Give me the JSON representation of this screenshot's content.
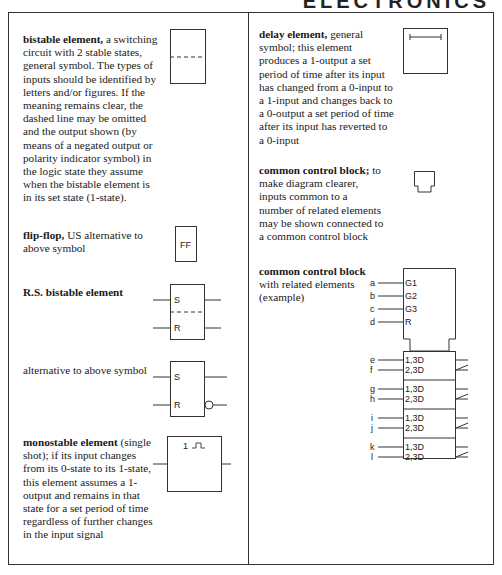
{
  "header": {
    "title": "ELECTRONICS"
  },
  "left_column": {
    "entries": [
      {
        "term": "bistable element,",
        "description": "a switching circuit with 2 stable states, general symbol. The types of inputs should be identified by letters and/or figures. If the meaning remains clear, the dashed line may be omitted and the output shown (by means of a negated output or polarity indicator symbol) in the logic state they assume when the bistable element is in its set state (1-state).",
        "symbol": "bistable-general-symbol"
      },
      {
        "term": "flip-flop,",
        "description": "US alternative to above symbol",
        "symbol": "flip-flop-symbol",
        "symbol_label": "FF"
      },
      {
        "term": "R.S. bistable element",
        "description": "",
        "symbol": "rs-bistable-symbol",
        "symbol_labels": [
          "S",
          "R"
        ]
      },
      {
        "term": "",
        "description": "alternative to above symbol",
        "symbol": "rs-bistable-alt-symbol",
        "symbol_labels": [
          "S",
          "R"
        ]
      },
      {
        "term": "monostable element",
        "description": "(single shot); if its input changes from its 0-state to its 1-state, this element assumes a 1-output and remains in that state for a set period of time regardless of further changes in the input signal",
        "symbol": "monostable-symbol",
        "symbol_label": "1"
      }
    ]
  },
  "right_column": {
    "entries": [
      {
        "term": "delay element,",
        "description": "general symbol; this element produces a 1-output a set period of time after its input has changed from a 0-input to a 1-input and changes back to a 0-output a set period of time after its input has reverted to a 0-input",
        "symbol": "delay-element-symbol"
      },
      {
        "term": "common control block;",
        "description": "to make diagram clearer, inputs common to a number of related elements may be shown connected to a common control block",
        "symbol": "common-control-block-symbol"
      },
      {
        "term": "common control block",
        "description": "with related elements (example)",
        "symbol": "common-control-block-example",
        "control_inputs": [
          {
            "pin": "a",
            "label": "G1"
          },
          {
            "pin": "b",
            "label": "G2"
          },
          {
            "pin": "c",
            "label": "G3"
          },
          {
            "pin": "d",
            "label": "R"
          }
        ],
        "elements": [
          {
            "inputs": [
              {
                "pin": "e",
                "label": "1,3D"
              },
              {
                "pin": "f",
                "label": "2,3D"
              }
            ]
          },
          {
            "inputs": [
              {
                "pin": "g",
                "label": "1,3D"
              },
              {
                "pin": "h",
                "label": "2,3D"
              }
            ]
          },
          {
            "inputs": [
              {
                "pin": "i",
                "label": "1,3D"
              },
              {
                "pin": "j",
                "label": "2,3D"
              }
            ]
          },
          {
            "inputs": [
              {
                "pin": "k",
                "label": "1,3D"
              },
              {
                "pin": "l",
                "label": "2,3D"
              }
            ]
          }
        ]
      }
    ]
  }
}
